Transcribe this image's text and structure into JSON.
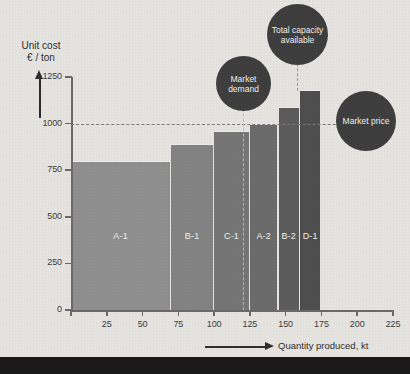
{
  "chart_data": {
    "type": "bar",
    "title": "",
    "xlabel": "Quantity produced, kt",
    "ylabel": "Unit cost\n€ / ton",
    "ylabel_line1": "Unit cost",
    "ylabel_line2": "€ / ton",
    "xlim": [
      0,
      225
    ],
    "ylim": [
      0,
      1250
    ],
    "grid": false,
    "legend": "none",
    "yticks": [
      0,
      250,
      500,
      750,
      1000,
      1250
    ],
    "ytick_labels": [
      "0",
      "250",
      "500",
      "750",
      "1000",
      "1250"
    ],
    "xticks": [
      0,
      25,
      50,
      75,
      100,
      125,
      150,
      175,
      200,
      225
    ],
    "xtick_labels": [
      "0",
      "25",
      "50",
      "75",
      "100",
      "125",
      "150",
      "175",
      "200",
      "225"
    ],
    "categories": [
      "A-1",
      "B-1",
      "C-1",
      "A-2",
      "B-2",
      "D-1"
    ],
    "values": [
      800,
      890,
      960,
      1000,
      1090,
      1180
    ],
    "bars": [
      {
        "label": "A-1",
        "x_start": 0,
        "x_end": 70,
        "width": 70,
        "unit_cost": 800,
        "color": "#8f8f8f"
      },
      {
        "label": "B-1",
        "x_start": 70,
        "x_end": 100,
        "width": 30,
        "unit_cost": 890,
        "color": "#838383"
      },
      {
        "label": "C-1",
        "x_start": 100,
        "x_end": 125,
        "width": 25,
        "unit_cost": 960,
        "color": "#757575"
      },
      {
        "label": "A-2",
        "x_start": 125,
        "x_end": 145,
        "width": 20,
        "unit_cost": 1000,
        "color": "#6b6b6b"
      },
      {
        "label": "B-2",
        "x_start": 145,
        "x_end": 160,
        "width": 15,
        "unit_cost": 1090,
        "color": "#5c5c5c"
      },
      {
        "label": "D-1",
        "x_start": 160,
        "x_end": 175,
        "width": 15,
        "unit_cost": 1180,
        "color": "#4e4e4e"
      }
    ],
    "annotations": [
      {
        "name": "market-price",
        "text": "Market price",
        "line1": "Market",
        "line2": "price",
        "type": "horizontal-reference",
        "value": 1000
      },
      {
        "name": "market-demand",
        "text": "Market demand",
        "line1": "Market",
        "line2": "demand",
        "type": "vertical-reference",
        "value": 125
      },
      {
        "name": "total-capacity",
        "text": "Total capacity available",
        "line1": "Total",
        "line2": "capacity",
        "line3": "available",
        "type": "vertical-reference",
        "value": 175
      }
    ]
  },
  "axes": {
    "y_title_line1": "Unit cost",
    "y_title_line2": "€ / ton",
    "x_title": "Quantity produced, kt"
  },
  "bubbles": {
    "market_demand": "Market demand",
    "total_capacity": "Total capacity available",
    "market_price": "Market price"
  },
  "footer": {
    "text": ""
  },
  "colors": {
    "background": "#e6e4e0",
    "axis": "#6a6a6a",
    "text": "#3c3c3c",
    "bubble": "#3e3e3e",
    "bubble_text": "#f0efec",
    "footer_band": "#1a1a1a"
  }
}
